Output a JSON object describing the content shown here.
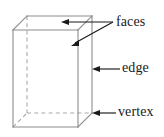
{
  "figure": {
    "type": "geometry-diagram",
    "shape_name": "rectangular prism",
    "width": 164,
    "height": 137,
    "background_color": "#ffffff",
    "solid_edge_color": "#8c8c8c",
    "hidden_edge_color": "#a8a8a8",
    "leader_color": "#1a1a1a",
    "hidden_edge_style": "dashed"
  },
  "callouts": [
    {
      "id": "faces",
      "label": "faces",
      "target_count": 2,
      "targets": [
        "top-face",
        "right-face"
      ],
      "arrow_directions": [
        "left",
        "down-left"
      ]
    },
    {
      "id": "edge",
      "label": "edge",
      "target_count": 1,
      "targets": [
        "right-front-vertical-edge"
      ],
      "arrow_directions": [
        "left"
      ]
    },
    {
      "id": "vertex",
      "label": "vertex",
      "target_count": 1,
      "targets": [
        "bottom-right-back-corner"
      ],
      "arrow_directions": [
        "left"
      ]
    }
  ],
  "geometry": {
    "front_face": [
      [
        13,
        30
      ],
      [
        78,
        30
      ],
      [
        78,
        127
      ],
      [
        13,
        127
      ]
    ],
    "back_face": [
      [
        27,
        16
      ],
      [
        92,
        16
      ],
      [
        92,
        113
      ],
      [
        27,
        113
      ]
    ],
    "visible_edges": [
      "front-top",
      "front-right",
      "front-bottom",
      "front-left",
      "back-top",
      "back-right",
      "top-left-diagonal",
      "top-right-diagonal",
      "bottom-right-diagonal",
      "back-right-vertical"
    ],
    "hidden_edges": [
      "back-left-vertical",
      "back-bottom",
      "bottom-left-diagonal"
    ]
  }
}
